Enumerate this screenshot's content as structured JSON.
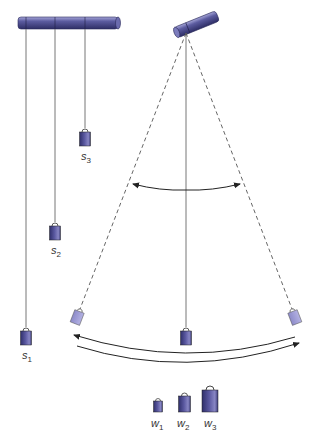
{
  "diagram": {
    "type": "pendulum-illustration",
    "colors": {
      "rod": "#4a4a8c",
      "rod_highlight": "#8f8fc4",
      "weight_dark": "#3f3f7e",
      "weight_light": "#9a98d0",
      "string": "#777777",
      "arrow": "#222222"
    },
    "left_panel": {
      "description": "Three pendulums of different string lengths hanging from a horizontal rod",
      "pendulums": [
        {
          "id": "s1",
          "label": "s",
          "subscript": "1"
        },
        {
          "id": "s2",
          "label": "s",
          "subscript": "2"
        },
        {
          "id": "s3",
          "label": "s",
          "subscript": "3"
        }
      ]
    },
    "right_panel": {
      "description": "Single pendulum swinging between two extreme positions (dashed), with arc arrows indicating swing motion"
    },
    "weights_legend": [
      {
        "id": "w1",
        "label": "w",
        "subscript": "1"
      },
      {
        "id": "w2",
        "label": "w",
        "subscript": "2"
      },
      {
        "id": "w3",
        "label": "w",
        "subscript": "3"
      }
    ]
  }
}
